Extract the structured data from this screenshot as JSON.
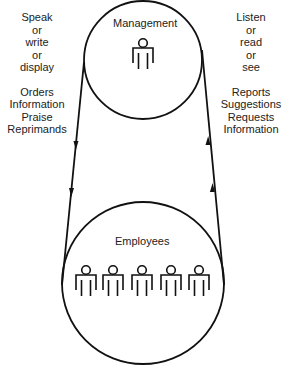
{
  "diagram": {
    "type": "communication-flow",
    "top_node": {
      "label": "Management",
      "figure_count": 1,
      "icon": "person-icon"
    },
    "bottom_node": {
      "label": "Employees",
      "figure_count": 5,
      "icon": "person-icon"
    },
    "downward_channel": {
      "direction": "Management to Employees",
      "modes": [
        "Speak",
        "or",
        "write",
        "or",
        "display"
      ],
      "content": [
        "Orders",
        "Information",
        "Praise",
        "Reprimands"
      ]
    },
    "upward_channel": {
      "direction": "Employees to Management",
      "modes": [
        "Listen",
        "or",
        "read",
        "or",
        "see"
      ],
      "content": [
        "Reports",
        "Suggestions",
        "Requests",
        "Information"
      ]
    },
    "colors": {
      "line": "#111111",
      "text": "#222222",
      "background": "#ffffff"
    }
  }
}
